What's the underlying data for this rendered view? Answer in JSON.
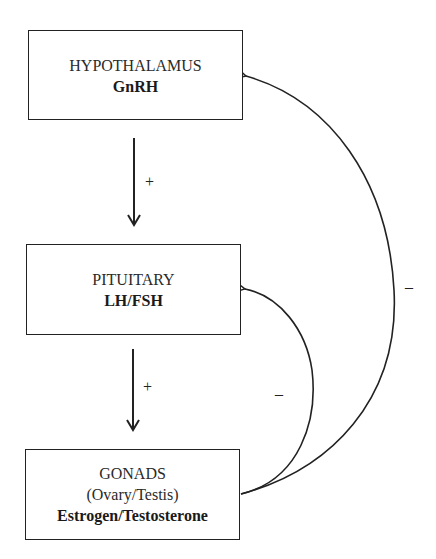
{
  "diagram": {
    "nodes": [
      {
        "id": "hypothalamus",
        "name": "HYPOTHALAMUS",
        "hormone": "GnRH"
      },
      {
        "id": "pituitary",
        "name": "PITUITARY",
        "hormone": "LH/FSH"
      },
      {
        "id": "gonads",
        "name": "GONADS",
        "subtitle": "(Ovary/Testis)",
        "hormone": "Estrogen/Testosterone"
      }
    ],
    "edges": [
      {
        "from": "hypothalamus",
        "to": "pituitary",
        "sign": "+",
        "type": "stimulation"
      },
      {
        "from": "pituitary",
        "to": "gonads",
        "sign": "+",
        "type": "stimulation"
      },
      {
        "from": "gonads",
        "to": "pituitary",
        "sign": "–",
        "type": "negative-feedback"
      },
      {
        "from": "gonads",
        "to": "hypothalamus",
        "sign": "–",
        "type": "negative-feedback"
      }
    ]
  },
  "labels": {
    "plus_hyp_pit": "+",
    "plus_pit_gon": "+",
    "minus_long": "–",
    "minus_short": "–"
  }
}
